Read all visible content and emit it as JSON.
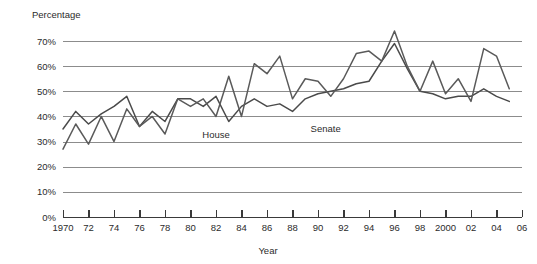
{
  "chart_data": {
    "type": "line",
    "title": "",
    "xlabel": "Year",
    "ylabel": "Percentage",
    "ylim": [
      0,
      75
    ],
    "y_ticks": [
      0,
      10,
      20,
      30,
      40,
      50,
      60,
      70
    ],
    "y_tick_labels": [
      "0%",
      "10%",
      "20%",
      "30%",
      "40%",
      "50%",
      "60%",
      "70%"
    ],
    "xlim": [
      1970,
      2006
    ],
    "x_ticks": [
      1970,
      1972,
      1974,
      1976,
      1978,
      1980,
      1982,
      1984,
      1986,
      1988,
      1990,
      1992,
      1994,
      1996,
      1998,
      2000,
      2002,
      2004,
      2006
    ],
    "x_tick_labels": [
      "1970",
      "72",
      "74",
      "76",
      "78",
      "80",
      "82",
      "84",
      "86",
      "88",
      "90",
      "92",
      "94",
      "96",
      "98",
      "2000",
      "02",
      "04",
      "06"
    ],
    "grid": true,
    "legend_position": "inline-annotation",
    "x": [
      1970,
      1971,
      1972,
      1973,
      1974,
      1975,
      1976,
      1977,
      1978,
      1979,
      1980,
      1981,
      1982,
      1983,
      1984,
      1985,
      1986,
      1987,
      1988,
      1989,
      1990,
      1991,
      1992,
      1993,
      1994,
      1995,
      1996,
      1997,
      1998,
      1999,
      2000,
      2001,
      2002,
      2003,
      2004,
      2005
    ],
    "series": [
      {
        "name": "House",
        "color": "#4a4a4a",
        "label": "House",
        "values": [
          35,
          42,
          37,
          41,
          44,
          48,
          36,
          42,
          38,
          47,
          47,
          44,
          48,
          38,
          44,
          47,
          44,
          45,
          42,
          47,
          49,
          50,
          51,
          53,
          54,
          62,
          69,
          59,
          50,
          49,
          47,
          48,
          48,
          51,
          48,
          46
        ]
      },
      {
        "name": "Senate",
        "color": "#5a5a5a",
        "label": "Senate",
        "values": [
          27,
          37,
          29,
          40,
          30,
          43,
          36,
          40,
          33,
          47,
          44,
          47,
          40,
          56,
          40,
          61,
          57,
          64,
          47,
          55,
          54,
          48,
          55,
          65,
          66,
          62,
          74,
          60,
          50,
          62,
          49,
          55,
          46,
          67,
          64,
          51
        ]
      }
    ],
    "annotations": [
      {
        "text": "House",
        "x_value": 1982.0,
        "y_value": 31.5
      },
      {
        "text": "Senate",
        "x_value": 1990.6,
        "y_value": 34.0
      }
    ]
  },
  "axis_labels": {
    "y_axis_title": "Percentage",
    "x_axis_title": "Year"
  }
}
